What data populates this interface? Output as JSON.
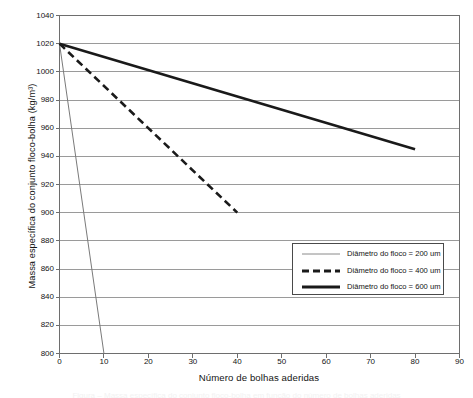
{
  "chart_data": {
    "type": "line",
    "title": "",
    "xlabel": "Número de bolhas aderidas",
    "ylabel": "Massa específica do conjunto floco-bolha (kg/m³)",
    "xlim": [
      0,
      90
    ],
    "ylim": [
      800,
      1040
    ],
    "xticks": [
      0,
      10,
      20,
      30,
      40,
      50,
      60,
      70,
      80,
      90
    ],
    "yticks": [
      800,
      820,
      840,
      860,
      880,
      900,
      920,
      940,
      960,
      980,
      1000,
      1020,
      1040
    ],
    "grid": "horizontal",
    "legend_position": "inside-lower-right",
    "series": [
      {
        "name": "Diâmetro do floco = 200 um",
        "style": "solid-thin",
        "color": "#7a7a7a",
        "width": 1,
        "x": [
          0,
          10
        ],
        "y": [
          1020,
          800
        ]
      },
      {
        "name": "Diâmetro do floco = 400 um",
        "style": "dashed-thick",
        "color": "#1a1a1a",
        "width": 2.6,
        "x": [
          0,
          40
        ],
        "y": [
          1020,
          900
        ]
      },
      {
        "name": "Diâmetro do floco = 600 um",
        "style": "solid-thick",
        "color": "#1a1a1a",
        "width": 2.6,
        "x": [
          0,
          80
        ],
        "y": [
          1020,
          945
        ]
      }
    ]
  },
  "axes": {
    "y_title": "Massa específica do conjunto floco-bolha (kg/m³)",
    "x_title": "Número de bolhas aderidas",
    "y_tick_labels": [
      "1040",
      "1020",
      "1000",
      "980",
      "960",
      "940",
      "920",
      "900",
      "880",
      "860",
      "840",
      "820",
      "800"
    ],
    "x_tick_labels": [
      "0",
      "10",
      "20",
      "30",
      "40",
      "50",
      "60",
      "70",
      "80",
      "90"
    ]
  },
  "legend": {
    "entries": [
      {
        "label": "Diâmetro do floco = 200 um",
        "swatch": "thin-gray-line"
      },
      {
        "label": "Diâmetro do floco = 400 um",
        "swatch": "thick-dashed-black-line"
      },
      {
        "label": "Diâmetro do floco = 600 um",
        "swatch": "thick-solid-black-line"
      }
    ]
  },
  "colors": {
    "grid": "#8f8f8f",
    "axis": "#6e6e6e",
    "series_200": "#7a7a7a",
    "series_400": "#1a1a1a",
    "series_600": "#1a1a1a",
    "text": "#141414",
    "background": "#ffffff"
  },
  "caption_sliver": "Figura – Massa específica do conjunto floco-bolha em função do número de bolhas aderidas"
}
